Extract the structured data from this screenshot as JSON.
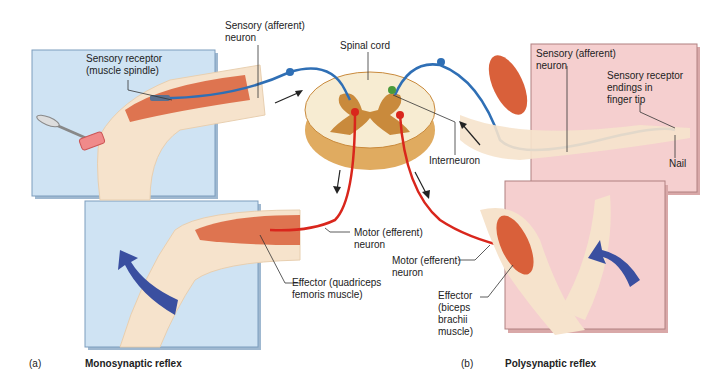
{
  "panel_a": {
    "caption_letter": "(a)",
    "caption_title": "Monosynaptic reflex",
    "labels": {
      "sensory_neuron": "Sensory (afferent)\nneuron",
      "sensory_receptor": "Sensory receptor\n(muscle spindle)",
      "motor_neuron": "Motor (efferent)\nneuron",
      "effector": "Effector (quadriceps\nfemoris muscle)"
    }
  },
  "center": {
    "spinal_cord": "Spinal cord",
    "interneuron": "Interneuron"
  },
  "panel_b": {
    "caption_letter": "(b)",
    "caption_title": "Polysynaptic reflex",
    "labels": {
      "sensory_neuron": "Sensory (afferent)\nneuron",
      "sensory_receptor": "Sensory receptor\nendings in\nfinger tip",
      "nail": "Nail",
      "motor_neuron": "Motor (efferent)\nneuron",
      "effector": "Effector\n(biceps\nbrachii\nmuscle)"
    }
  },
  "colors": {
    "panel_a_bg": "#cfe3f3",
    "panel_b_bg": "#f5cfcf",
    "sensory": "#2f6fb5",
    "motor": "#d9261c",
    "interneuron": "#4a9a3a",
    "skin": "#f6e3cc",
    "muscle": "#d9603a",
    "arrow": "#3a4fa0",
    "cord_grey": "#c98a3c",
    "cord_white": "#f7ecd2"
  }
}
